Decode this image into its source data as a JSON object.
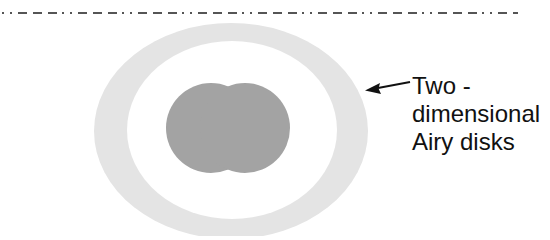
{
  "diagram": {
    "reference_line": {
      "style": "dash-dot-dot",
      "y": 13,
      "x_start": 2,
      "x_end": 518,
      "color": "#555555"
    },
    "outer_ring": {
      "center": [
        231,
        131
      ],
      "outer_radii": [
        137,
        108
      ],
      "inner_radii": [
        105,
        89
      ],
      "color": "#e4e4e4"
    },
    "airy_disks": [
      {
        "center": [
          211,
          128
        ],
        "radius": 45,
        "color": "#a3a3a3"
      },
      {
        "center": [
          245,
          128
        ],
        "radius": 45,
        "color": "#a3a3a3"
      }
    ],
    "callout": {
      "arrow_from": [
        410,
        82
      ],
      "arrow_to": [
        366,
        90
      ],
      "arrow_color": "#111111",
      "label_lines": [
        "Two -",
        "dimensional",
        "Airy disks"
      ]
    }
  }
}
